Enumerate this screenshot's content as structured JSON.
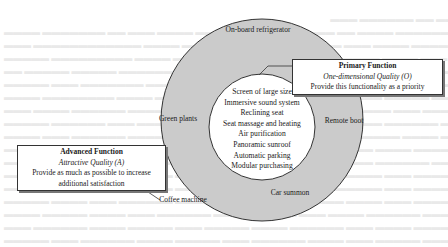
{
  "diagram": {
    "type": "kano-concentric-circles",
    "colors": {
      "outer_ring_fill": "#cbcbcb",
      "inner_circle_fill": "#ffffff",
      "stroke": "#333333",
      "background_text": "#e9e9e9"
    },
    "inner_circle": {
      "features": [
        "Screen of large size",
        "Immersive sound system",
        "Reclining seat",
        "Seat massage and heating",
        "Air purification",
        "Panoramic sunroof",
        "Automatic parking",
        "Modular purchasing"
      ]
    },
    "outer_ring": {
      "features": {
        "top": "On-board refrigerator",
        "left": "Green plants",
        "right": "Remote boot",
        "bottom_left": "Coffee machine",
        "bottom_right": "Car summon"
      }
    },
    "callouts": {
      "primary": {
        "title": "Primary Function",
        "quality": "One-dimensional Quality (O)",
        "description": "Provide this functionality as a priority"
      },
      "advanced": {
        "title": "Advanced Function",
        "quality": "Attractive Quality (A)",
        "description_line1": "Provide as much as possible to increase",
        "description_line2": "additional satisfaction"
      }
    }
  }
}
